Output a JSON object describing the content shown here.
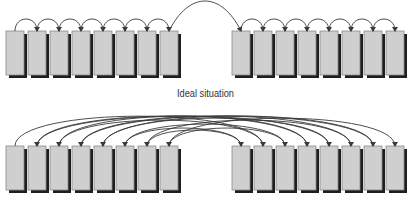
{
  "caption": "Ideal situation",
  "colors": {
    "block_fill": "#cfcfcf",
    "block_border": "#8a8a8a",
    "block_shadow": "#1e1e1e",
    "arrow": "#3a3a3a",
    "caption": "#333333"
  },
  "panels": [
    {
      "name": "ideal",
      "top": 31,
      "height": 44,
      "groups": [
        {
          "x0": 6,
          "count": 8
        },
        {
          "x0": 232,
          "count": 8
        }
      ]
    },
    {
      "name": "fragmented",
      "top": 146,
      "height": 44,
      "groups": [
        {
          "x0": 6,
          "count": 8
        },
        {
          "x0": 232,
          "count": 8
        }
      ]
    }
  ]
}
